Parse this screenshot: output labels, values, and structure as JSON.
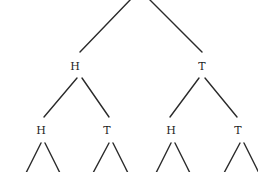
{
  "diagram": {
    "type": "probability-tree",
    "line_color": "#2a2a2a",
    "text_color": "#1e1e1e",
    "background": "#ffffff",
    "level1": [
      {
        "label": "H"
      },
      {
        "label": "T"
      }
    ],
    "level2": [
      {
        "label": "H",
        "parent": "H"
      },
      {
        "label": "T",
        "parent": "H"
      },
      {
        "label": "H",
        "parent": "T"
      },
      {
        "label": "T",
        "parent": "T"
      }
    ]
  }
}
